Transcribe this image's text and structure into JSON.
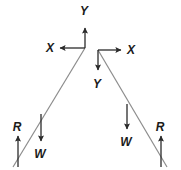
{
  "diagram": {
    "type": "free-body-diagram",
    "title": "",
    "background_color": "#ffffff",
    "stroke_color": "#2b2b2b",
    "line_color": "#8c8c8c",
    "label_color": "#1b1b1b",
    "width": 181,
    "height": 170,
    "members": [
      {
        "name": "left-member",
        "label": "",
        "from": {
          "x": 85,
          "y": 48
        },
        "to": {
          "x": 13,
          "y": 167
        }
      },
      {
        "name": "right-member",
        "label": "",
        "from": {
          "x": 98,
          "y": 50
        },
        "to": {
          "x": 167,
          "y": 167
        }
      }
    ],
    "axes": [
      {
        "name": "left-axis-system",
        "origin": {
          "x": 85,
          "y": 48
        },
        "y_axis": {
          "label": "Y",
          "direction": "up",
          "label_x": 84,
          "label_y": 15,
          "tip": {
            "x": 85,
            "y": 26
          }
        },
        "x_axis": {
          "label": "X",
          "direction": "left",
          "label_x": 50,
          "label_y": 48,
          "tip": {
            "x": 58,
            "y": 48
          }
        }
      },
      {
        "name": "right-axis-system",
        "origin": {
          "x": 98,
          "y": 50
        },
        "y_axis": {
          "label": "Y",
          "direction": "down",
          "label_x": 97,
          "label_y": 84,
          "tip": {
            "x": 98,
            "y": 72
          }
        },
        "x_axis": {
          "label": "X",
          "direction": "right",
          "label_x": 131,
          "label_y": 50,
          "tip": {
            "x": 123,
            "y": 50
          }
        }
      }
    ],
    "forces": [
      {
        "name": "left-reaction",
        "label": "R",
        "direction": "up",
        "tail": {
          "x": 18,
          "y": 167
        },
        "tip": {
          "x": 18,
          "y": 134
        },
        "label_x": 17,
        "label_y": 128
      },
      {
        "name": "left-weight",
        "label": "W",
        "direction": "down",
        "tail": {
          "x": 41,
          "y": 114
        },
        "tip": {
          "x": 41,
          "y": 143
        },
        "label_x": 40,
        "label_y": 157
      },
      {
        "name": "right-weight",
        "label": "W",
        "direction": "down",
        "tail": {
          "x": 127,
          "y": 104
        },
        "tip": {
          "x": 127,
          "y": 131
        },
        "label_x": 126,
        "label_y": 145
      },
      {
        "name": "right-reaction",
        "label": "R",
        "direction": "up",
        "tail": {
          "x": 161,
          "y": 167
        },
        "tip": {
          "x": 161,
          "y": 134
        },
        "label_x": 160,
        "label_y": 128
      }
    ]
  }
}
